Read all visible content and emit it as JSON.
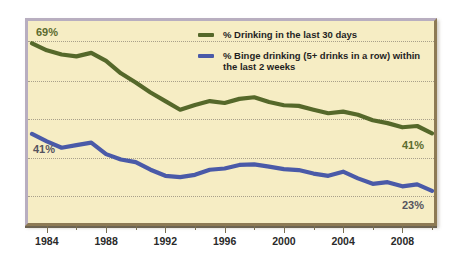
{
  "legend": {
    "items": [
      {
        "label": "% Drinking in the last 30 days",
        "color": "#55682a",
        "name": "legend-drinking-30-days"
      },
      {
        "label": "% Binge drinking (5+ drinks in a row) within the last 2 weeks",
        "color": "#4a5aa8",
        "name": "legend-binge-drinking"
      }
    ]
  },
  "annotations": {
    "start_drinking": "69%",
    "start_binge": "41%",
    "end_drinking": "41%",
    "end_binge": "23%"
  },
  "colors": {
    "background": "#f6edc4",
    "drinking_line": "#55682a",
    "binge_line": "#4a5aa8",
    "gridline": "#a8a08a",
    "axis": "#6d6452",
    "label_green": "#5b6b2e",
    "label_slate": "#55545e"
  },
  "chart_data": {
    "type": "line",
    "title": "",
    "xlabel": "",
    "ylabel": "",
    "xlim": [
      1983,
      2010
    ],
    "ylim": [
      15,
      72
    ],
    "grid": true,
    "grid_values": [
      69,
      57,
      46,
      34,
      23
    ],
    "legend_position": "top-right",
    "tick_labels": [
      "1984",
      "1988",
      "1992",
      "1996",
      "2000",
      "2004",
      "2008"
    ],
    "tick_values": [
      1984,
      1988,
      1992,
      1996,
      2000,
      2004,
      2008
    ],
    "minor_tick_values": [
      1986,
      1990,
      1994,
      1998,
      2002,
      2006,
      2010
    ],
    "x": [
      1983,
      1984,
      1985,
      1986,
      1987,
      1988,
      1989,
      1990,
      1991,
      1992,
      1993,
      1994,
      1995,
      1996,
      1997,
      1998,
      1999,
      2000,
      2001,
      2002,
      2003,
      2004,
      2005,
      2006,
      2007,
      2008,
      2009,
      2010
    ],
    "series": [
      {
        "name": "% Drinking in the last 30 days",
        "color": "#55682a",
        "values": [
          69.4,
          67.2,
          65.9,
          65.3,
          66.4,
          63.9,
          60.0,
          57.1,
          54.0,
          51.3,
          48.6,
          50.1,
          51.3,
          50.7,
          52.0,
          52.5,
          51.0,
          50.0,
          49.8,
          48.6,
          47.5,
          48.0,
          47.0,
          45.3,
          44.4,
          43.1,
          43.5,
          41.2
        ]
      },
      {
        "name": "% Binge drinking (5+ drinks in a row) within the last 2 weeks",
        "color": "#4a5aa8",
        "values": [
          41.0,
          38.7,
          36.7,
          37.5,
          38.3,
          34.7,
          33.0,
          32.2,
          29.8,
          27.9,
          27.5,
          28.2,
          29.8,
          30.2,
          31.3,
          31.5,
          30.8,
          30.0,
          29.7,
          28.6,
          27.9,
          29.2,
          27.1,
          25.4,
          25.9,
          24.6,
          25.2,
          23.2
        ]
      }
    ]
  }
}
